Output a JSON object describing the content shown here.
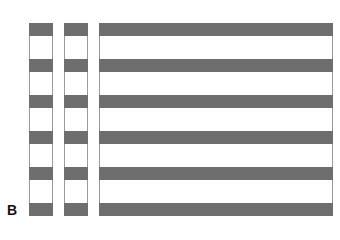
{
  "panel_label": "B",
  "columns": [
    {
      "name": "column-1",
      "left": 29,
      "width": 24
    },
    {
      "name": "column-2",
      "left": 64,
      "width": 24
    },
    {
      "name": "column-3",
      "left": 99,
      "width": 234
    }
  ],
  "bands": {
    "count": 6,
    "top_offsets": [
      0,
      36,
      72,
      108,
      144,
      180
    ],
    "height": 13,
    "color": "#6e6e6e"
  },
  "colors": {
    "band": "#6e6e6e",
    "border": "#9a9a9a",
    "background": "#ffffff"
  }
}
